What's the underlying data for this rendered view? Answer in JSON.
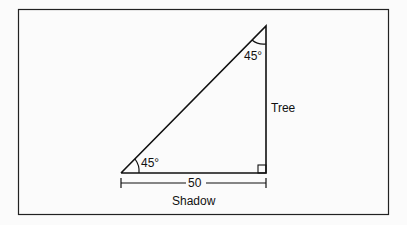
{
  "diagram": {
    "type": "right-triangle",
    "labels": {
      "top_angle": "45°",
      "bottom_angle": "45°",
      "vertical_side": "Tree",
      "horizontal_side": "Shadow",
      "horizontal_length": "50"
    },
    "colors": {
      "line": "#111111",
      "background": "#fbfbfb"
    }
  }
}
